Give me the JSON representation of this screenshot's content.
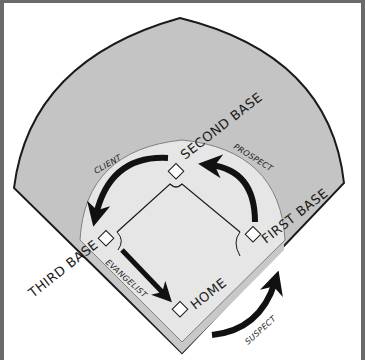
{
  "diagram": {
    "colors": {
      "outfield": "#c4c4c4",
      "infield_dirt": "#e6e6e6",
      "infield_grass": "#eeeeee",
      "line": "#1a1a1a",
      "frame": "#6a6a6a",
      "background": "#ffffff"
    },
    "bases": [
      {
        "id": "home",
        "label": "HOME"
      },
      {
        "id": "first",
        "label": "FIRST BASE"
      },
      {
        "id": "second",
        "label": "SECOND BASE"
      },
      {
        "id": "third",
        "label": "THIRD BASE"
      }
    ],
    "stages": [
      {
        "id": "suspect",
        "label": "SUSPECT",
        "from": "outside",
        "to": "first"
      },
      {
        "id": "prospect",
        "label": "PROSPECT",
        "from": "first",
        "to": "second"
      },
      {
        "id": "client",
        "label": "CLIENT",
        "from": "second",
        "to": "third"
      },
      {
        "id": "evangelist",
        "label": "EVANGELIST",
        "from": "third",
        "to": "home"
      }
    ]
  }
}
